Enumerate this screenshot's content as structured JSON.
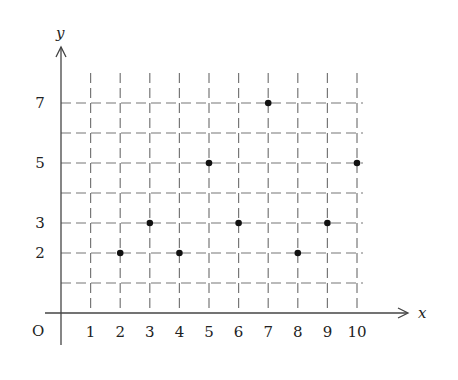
{
  "chart_data": {
    "type": "scatter",
    "title": "",
    "xlabel": "x",
    "ylabel": "y",
    "origin_label": "O",
    "x_ticks": [
      1,
      2,
      3,
      4,
      5,
      6,
      7,
      8,
      9,
      10
    ],
    "y_ticks": [
      2,
      3,
      5,
      7
    ],
    "xlim": [
      0,
      10
    ],
    "ylim": [
      0,
      8
    ],
    "grid": "dashed",
    "points": [
      {
        "x": 2,
        "y": 2
      },
      {
        "x": 3,
        "y": 3
      },
      {
        "x": 4,
        "y": 2
      },
      {
        "x": 5,
        "y": 5
      },
      {
        "x": 6,
        "y": 3
      },
      {
        "x": 7,
        "y": 7
      },
      {
        "x": 8,
        "y": 2
      },
      {
        "x": 9,
        "y": 3
      },
      {
        "x": 10,
        "y": 5
      }
    ],
    "x": [
      2,
      3,
      4,
      5,
      6,
      7,
      8,
      9,
      10
    ],
    "series": [
      {
        "name": "points",
        "values": [
          2,
          3,
          2,
          5,
          3,
          7,
          2,
          3,
          5
        ]
      }
    ]
  },
  "colors": {
    "axis": "#444444",
    "grid": "#777777",
    "point": "#111111"
  }
}
